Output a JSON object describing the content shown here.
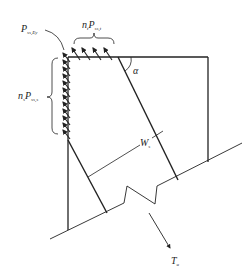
{
  "diagram": {
    "type": "structural free-body diagram",
    "labels": {
      "p_corner": {
        "main": "P",
        "sub": "ss,Ey"
      },
      "top_force": {
        "coef": "n",
        "coef_sub": "t",
        "main": "P",
        "sub": "ss,t"
      },
      "side_force": {
        "coef": "n",
        "coef_sub": "s",
        "main": "P",
        "sub": "ss,s"
      },
      "angle": "α",
      "width": {
        "main": "W",
        "sub": "s"
      },
      "tension": {
        "main": "T",
        "sub": "u"
      }
    },
    "colors": {
      "line": "#222222",
      "text": "#222222",
      "background": "#ffffff"
    }
  }
}
